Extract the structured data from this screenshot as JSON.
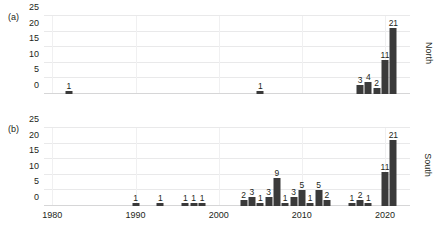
{
  "chart_data": [
    {
      "type": "bar",
      "panel_tag": "(a)",
      "title": "",
      "series_label": "North",
      "xlabel": "",
      "ylabel": "",
      "xlim": [
        1979,
        2023
      ],
      "ylim": [
        0,
        25
      ],
      "yticks": [
        0,
        5,
        10,
        15,
        20,
        25
      ],
      "xticks": [
        1980,
        1990,
        2000,
        2010,
        2020
      ],
      "grid": true,
      "legend": "none",
      "x": [
        1982,
        2005,
        2017,
        2018,
        2019,
        2020,
        2021
      ],
      "values": [
        1,
        1,
        3,
        4,
        2,
        11,
        21
      ],
      "bar_labels": [
        "1",
        "1",
        "3",
        "4",
        "2",
        "11",
        "21"
      ]
    },
    {
      "type": "bar",
      "panel_tag": "(b)",
      "title": "",
      "series_label": "South",
      "xlabel": "",
      "ylabel": "",
      "xlim": [
        1979,
        2023
      ],
      "ylim": [
        0,
        25
      ],
      "yticks": [
        0,
        5,
        10,
        15,
        20,
        25
      ],
      "xticks": [
        1980,
        1990,
        2000,
        2010,
        2020
      ],
      "grid": true,
      "legend": "none",
      "x": [
        1990,
        1993,
        1996,
        1997,
        1998,
        2003,
        2004,
        2005,
        2006,
        2007,
        2008,
        2009,
        2010,
        2011,
        2012,
        2013,
        2016,
        2017,
        2018,
        2020,
        2021
      ],
      "values": [
        1,
        1,
        1,
        1,
        1,
        2,
        3,
        1,
        3,
        9,
        1,
        3,
        5,
        1,
        5,
        2,
        1,
        2,
        1,
        11,
        21
      ],
      "bar_labels": [
        "1",
        "1",
        "1",
        "1",
        "1",
        "2",
        "3",
        "1",
        "3",
        "9",
        "1",
        "3",
        "5",
        "1",
        "5",
        "2",
        "1",
        "2",
        "1",
        "11",
        "21"
      ]
    }
  ]
}
